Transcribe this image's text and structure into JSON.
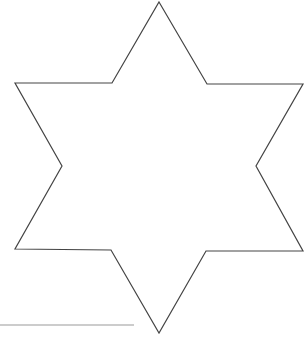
{
  "figure": {
    "shape": "six-pointed-star",
    "stroke_color": "#444444",
    "fill_color": "#ffffff",
    "stroke_width": 1.2,
    "points": [
      [
        159,
        2
      ],
      [
        207,
        84
      ],
      [
        303,
        84
      ],
      [
        256,
        166
      ],
      [
        303,
        251
      ],
      [
        206,
        251
      ],
      [
        159,
        333
      ],
      [
        111,
        250
      ],
      [
        15,
        249
      ],
      [
        62,
        166
      ],
      [
        15,
        83
      ],
      [
        112,
        83
      ]
    ]
  },
  "underline": {
    "x1": 0,
    "y1": 325,
    "x2": 134,
    "y2": 325,
    "color": "#9a9a9a",
    "stroke_width": 1.2
  }
}
